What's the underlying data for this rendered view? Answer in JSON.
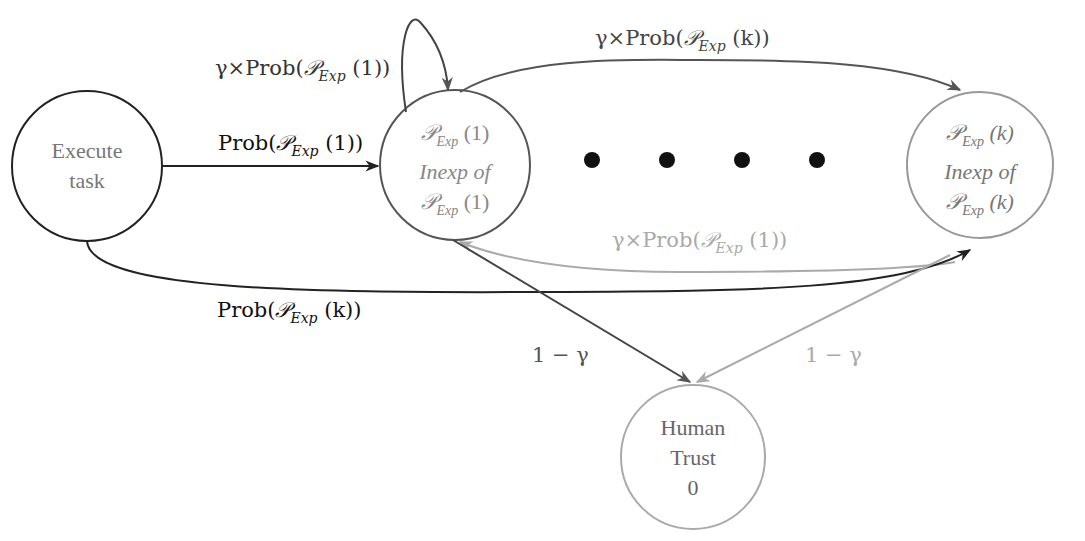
{
  "diagram": {
    "type": "state-transition",
    "nodes": [
      {
        "id": "execute",
        "lines": [
          "Execute",
          "task"
        ],
        "cx": 87,
        "cy": 166,
        "r": 75,
        "stroke": "#222222",
        "text_color": "#777777"
      },
      {
        "id": "p1",
        "lines": [
          "𝒫",
          "Exp",
          "(1)",
          "Inexp of",
          "𝒫",
          "Exp",
          "(1)"
        ],
        "cx": 455,
        "cy": 165,
        "r": 75,
        "stroke": "#555555",
        "text_color": "#888888"
      },
      {
        "id": "pk",
        "lines": [
          "𝒫",
          "Exp",
          "(k)",
          "Inexp of",
          "𝒫",
          "Exp",
          "(k)"
        ],
        "cx": 980,
        "cy": 165,
        "r": 73,
        "stroke": "#999999",
        "text_color": "#777777"
      },
      {
        "id": "trust",
        "lines": [
          "Human",
          "Trust",
          "0"
        ],
        "cx": 693,
        "cy": 457,
        "r": 72,
        "stroke": "#aaaaaa",
        "text_color": "#666666"
      }
    ],
    "ellipsis_dots": [
      {
        "cx": 592,
        "cy": 160
      },
      {
        "cx": 667,
        "cy": 160
      },
      {
        "cx": 742,
        "cy": 160
      },
      {
        "cx": 817,
        "cy": 160
      }
    ],
    "edges": [
      {
        "from": "execute",
        "to": "p1",
        "label": "Prob(𝒫_Exp (1))",
        "color": "#222222"
      },
      {
        "from": "p1",
        "to": "p1",
        "label": "γ×Prob(𝒫_Exp (1))",
        "color": "#444444"
      },
      {
        "from": "p1",
        "to": "pk",
        "label": "γ×Prob(𝒫_Exp (k))",
        "color": "#555555"
      },
      {
        "from": "pk",
        "to": "p1",
        "label": "γ×Prob(𝒫_Exp (1))",
        "color": "#aaaaaa"
      },
      {
        "from": "execute",
        "to": "pk",
        "label": "Prob(𝒫_Exp (k))",
        "color": "#222222"
      },
      {
        "from": "p1",
        "to": "trust",
        "label": "1 − γ",
        "color": "#444444"
      },
      {
        "from": "pk",
        "to": "trust",
        "label": "1 − γ",
        "color": "#aaaaaa"
      }
    ]
  },
  "labels": {
    "self_loop": {
      "pre": "γ×Prob(",
      "cal": "𝒫",
      "sub": "Exp",
      "post": " (1))"
    },
    "exec_to_p1": {
      "pre": "Prob(",
      "cal": "𝒫",
      "sub": "Exp",
      "post": " (1))"
    },
    "p1_to_pk": {
      "pre": "γ×Prob(",
      "cal": "𝒫",
      "sub": "Exp",
      "post": " (k))"
    },
    "pk_to_p1": {
      "pre": "γ×Prob(",
      "cal": "𝒫",
      "sub": "Exp",
      "post": " (1))"
    },
    "exec_to_pk": {
      "pre": "Prob(",
      "cal": "𝒫",
      "sub": "Exp",
      "post": " (k))"
    },
    "p1_to_trust": "1 − γ",
    "pk_to_trust": "1 − γ"
  },
  "nodes_text": {
    "execute": {
      "l1": "Execute",
      "l2": "task"
    },
    "p1": {
      "cal": "𝒫",
      "sub": "Exp",
      "arg": " (1)",
      "mid": "Inexp of"
    },
    "pk": {
      "cal": "𝒫",
      "sub": "Exp",
      "arg": " (k)",
      "mid": "Inexp of"
    },
    "trust": {
      "l1": "Human",
      "l2": "Trust",
      "l3": "0"
    }
  }
}
